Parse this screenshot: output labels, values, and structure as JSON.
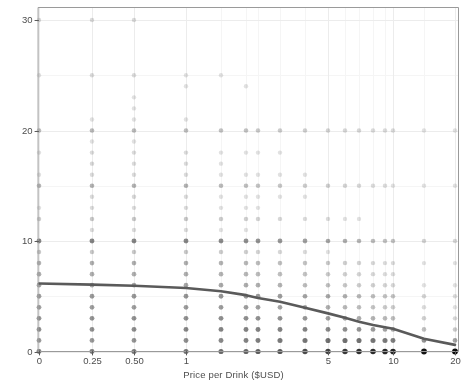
{
  "chart_data": {
    "type": "scatter",
    "title": "",
    "subtitle": "",
    "xlabel": "Price per Drink ($USD)",
    "ylabel": "Hypothetical Drinks Purchased",
    "x_scale": "log-like-ordinal",
    "xticks": [
      0,
      0.25,
      0.5,
      1,
      5,
      10,
      20
    ],
    "xtick_labels": [
      "0",
      "0.25",
      "0.50",
      "1",
      "5",
      "10",
      "20"
    ],
    "xtick_px": [
      39,
      92,
      134,
      186,
      328,
      390,
      455
    ],
    "yticks": [
      0,
      10,
      20,
      30
    ],
    "ytick_labels": [
      "0",
      "10",
      "20",
      "30"
    ],
    "ylim": [
      0,
      31
    ],
    "grid": true,
    "grid_major_color": "#ececec",
    "grid_minor_color": "#f5f5f5",
    "panel_border_color": "#9a9a9a",
    "point_color": "#111111",
    "point_shape": "circle",
    "point_radius_px": 2.6,
    "point_alpha_note": "alpha proportional to count of overlapping responses",
    "legend": "none",
    "legend_position": "none",
    "prices": [
      0,
      0.25,
      0.5,
      1,
      1.5,
      2,
      2.5,
      3,
      4,
      5,
      6,
      7,
      8,
      9,
      10,
      15,
      20
    ],
    "price_px": [
      39,
      92,
      134,
      186,
      221,
      246,
      258,
      280,
      305,
      328,
      345,
      359,
      373,
      385,
      393,
      424,
      455
    ],
    "y_values_grid": [
      0,
      1,
      2,
      3,
      4,
      5,
      6,
      7,
      8,
      9,
      10,
      11,
      12,
      13,
      14,
      15,
      16,
      17,
      18,
      19,
      20,
      21,
      22,
      23,
      24,
      25,
      26,
      27,
      28,
      29,
      30
    ],
    "counts": [
      {
        "price": 0,
        "points": [
          [
            0,
            60
          ],
          [
            1,
            34
          ],
          [
            2,
            42
          ],
          [
            3,
            38
          ],
          [
            4,
            30
          ],
          [
            5,
            30
          ],
          [
            6,
            26
          ],
          [
            7,
            20
          ],
          [
            8,
            18
          ],
          [
            9,
            8
          ],
          [
            10,
            52
          ],
          [
            12,
            6
          ],
          [
            13,
            2
          ],
          [
            15,
            16
          ],
          [
            16,
            2
          ],
          [
            18,
            2
          ],
          [
            20,
            12
          ],
          [
            25,
            2
          ],
          [
            30,
            3
          ]
        ]
      },
      {
        "price": 0.25,
        "points": [
          [
            0,
            62
          ],
          [
            1,
            36
          ],
          [
            2,
            44
          ],
          [
            3,
            40
          ],
          [
            4,
            32
          ],
          [
            5,
            34
          ],
          [
            6,
            26
          ],
          [
            7,
            20
          ],
          [
            8,
            20
          ],
          [
            9,
            8
          ],
          [
            10,
            54
          ],
          [
            11,
            3
          ],
          [
            12,
            8
          ],
          [
            13,
            3
          ],
          [
            14,
            3
          ],
          [
            15,
            18
          ],
          [
            16,
            3
          ],
          [
            17,
            4
          ],
          [
            18,
            3
          ],
          [
            19,
            2
          ],
          [
            20,
            14
          ],
          [
            21,
            2
          ],
          [
            25,
            3
          ],
          [
            30,
            3
          ]
        ]
      },
      {
        "price": 0.5,
        "points": [
          [
            0,
            66
          ],
          [
            1,
            40
          ],
          [
            2,
            48
          ],
          [
            3,
            42
          ],
          [
            4,
            32
          ],
          [
            5,
            36
          ],
          [
            6,
            26
          ],
          [
            7,
            20
          ],
          [
            8,
            20
          ],
          [
            9,
            8
          ],
          [
            10,
            54
          ],
          [
            11,
            3
          ],
          [
            12,
            8
          ],
          [
            13,
            3
          ],
          [
            14,
            4
          ],
          [
            15,
            18
          ],
          [
            16,
            3
          ],
          [
            17,
            3
          ],
          [
            18,
            3
          ],
          [
            19,
            2
          ],
          [
            20,
            14
          ],
          [
            21,
            2
          ],
          [
            22,
            2
          ],
          [
            23,
            2
          ],
          [
            25,
            3
          ],
          [
            30,
            3
          ]
        ]
      },
      {
        "price": 1,
        "points": [
          [
            0,
            74
          ],
          [
            1,
            46
          ],
          [
            2,
            54
          ],
          [
            3,
            44
          ],
          [
            4,
            34
          ],
          [
            5,
            38
          ],
          [
            6,
            26
          ],
          [
            7,
            20
          ],
          [
            8,
            20
          ],
          [
            9,
            8
          ],
          [
            10,
            52
          ],
          [
            11,
            3
          ],
          [
            12,
            8
          ],
          [
            13,
            3
          ],
          [
            14,
            3
          ],
          [
            15,
            18
          ],
          [
            16,
            3
          ],
          [
            17,
            3
          ],
          [
            18,
            3
          ],
          [
            20,
            12
          ],
          [
            21,
            2
          ],
          [
            24,
            2
          ],
          [
            25,
            2
          ]
        ]
      },
      {
        "price": 1.5,
        "points": [
          [
            0,
            82
          ],
          [
            1,
            52
          ],
          [
            2,
            56
          ],
          [
            3,
            46
          ],
          [
            4,
            34
          ],
          [
            5,
            38
          ],
          [
            6,
            24
          ],
          [
            7,
            18
          ],
          [
            8,
            18
          ],
          [
            9,
            7
          ],
          [
            10,
            48
          ],
          [
            11,
            2
          ],
          [
            12,
            7
          ],
          [
            13,
            2
          ],
          [
            14,
            2
          ],
          [
            15,
            14
          ],
          [
            16,
            2
          ],
          [
            17,
            2
          ],
          [
            18,
            2
          ],
          [
            20,
            10
          ],
          [
            25,
            2
          ]
        ]
      },
      {
        "price": 2,
        "points": [
          [
            0,
            92
          ],
          [
            1,
            58
          ],
          [
            2,
            58
          ],
          [
            3,
            46
          ],
          [
            4,
            32
          ],
          [
            5,
            36
          ],
          [
            6,
            22
          ],
          [
            7,
            16
          ],
          [
            8,
            16
          ],
          [
            9,
            6
          ],
          [
            10,
            44
          ],
          [
            11,
            2
          ],
          [
            12,
            6
          ],
          [
            13,
            2
          ],
          [
            14,
            2
          ],
          [
            15,
            12
          ],
          [
            16,
            2
          ],
          [
            18,
            2
          ],
          [
            20,
            10
          ],
          [
            24,
            2
          ]
        ]
      },
      {
        "price": 2.5,
        "points": [
          [
            0,
            102
          ],
          [
            1,
            62
          ],
          [
            2,
            58
          ],
          [
            3,
            44
          ],
          [
            4,
            30
          ],
          [
            5,
            34
          ],
          [
            6,
            20
          ],
          [
            7,
            14
          ],
          [
            8,
            14
          ],
          [
            9,
            5
          ],
          [
            10,
            40
          ],
          [
            12,
            5
          ],
          [
            13,
            2
          ],
          [
            14,
            2
          ],
          [
            15,
            10
          ],
          [
            16,
            2
          ],
          [
            18,
            2
          ],
          [
            20,
            8
          ]
        ]
      },
      {
        "price": 3,
        "points": [
          [
            0,
            116
          ],
          [
            1,
            68
          ],
          [
            2,
            58
          ],
          [
            3,
            42
          ],
          [
            4,
            28
          ],
          [
            5,
            32
          ],
          [
            6,
            18
          ],
          [
            7,
            12
          ],
          [
            8,
            12
          ],
          [
            9,
            4
          ],
          [
            10,
            36
          ],
          [
            12,
            4
          ],
          [
            14,
            2
          ],
          [
            15,
            9
          ],
          [
            16,
            2
          ],
          [
            18,
            2
          ],
          [
            20,
            7
          ]
        ]
      },
      {
        "price": 4,
        "points": [
          [
            0,
            136
          ],
          [
            1,
            74
          ],
          [
            2,
            56
          ],
          [
            3,
            38
          ],
          [
            4,
            24
          ],
          [
            5,
            28
          ],
          [
            6,
            14
          ],
          [
            7,
            10
          ],
          [
            8,
            10
          ],
          [
            9,
            3
          ],
          [
            10,
            30
          ],
          [
            12,
            3
          ],
          [
            14,
            2
          ],
          [
            15,
            7
          ],
          [
            16,
            2
          ],
          [
            20,
            6
          ]
        ]
      },
      {
        "price": 5,
        "points": [
          [
            0,
            158
          ],
          [
            1,
            80
          ],
          [
            2,
            52
          ],
          [
            3,
            32
          ],
          [
            4,
            20
          ],
          [
            5,
            24
          ],
          [
            6,
            12
          ],
          [
            7,
            8
          ],
          [
            8,
            8
          ],
          [
            9,
            2
          ],
          [
            10,
            26
          ],
          [
            12,
            3
          ],
          [
            15,
            6
          ],
          [
            20,
            5
          ]
        ]
      },
      {
        "price": 6,
        "points": [
          [
            0,
            176
          ],
          [
            1,
            80
          ],
          [
            2,
            46
          ],
          [
            3,
            28
          ],
          [
            4,
            16
          ],
          [
            5,
            20
          ],
          [
            6,
            9
          ],
          [
            7,
            6
          ],
          [
            8,
            6
          ],
          [
            10,
            20
          ],
          [
            12,
            2
          ],
          [
            15,
            5
          ],
          [
            20,
            4
          ]
        ]
      },
      {
        "price": 7,
        "points": [
          [
            0,
            192
          ],
          [
            1,
            78
          ],
          [
            2,
            40
          ],
          [
            3,
            22
          ],
          [
            4,
            13
          ],
          [
            5,
            16
          ],
          [
            6,
            7
          ],
          [
            7,
            5
          ],
          [
            8,
            5
          ],
          [
            10,
            16
          ],
          [
            12,
            2
          ],
          [
            15,
            4
          ],
          [
            20,
            4
          ]
        ]
      },
      {
        "price": 8,
        "points": [
          [
            0,
            206
          ],
          [
            1,
            74
          ],
          [
            2,
            34
          ],
          [
            3,
            18
          ],
          [
            4,
            10
          ],
          [
            5,
            13
          ],
          [
            6,
            6
          ],
          [
            7,
            4
          ],
          [
            8,
            4
          ],
          [
            10,
            13
          ],
          [
            15,
            3
          ],
          [
            20,
            3
          ]
        ]
      },
      {
        "price": 9,
        "points": [
          [
            0,
            216
          ],
          [
            1,
            68
          ],
          [
            2,
            28
          ],
          [
            3,
            15
          ],
          [
            4,
            8
          ],
          [
            5,
            11
          ],
          [
            6,
            5
          ],
          [
            7,
            3
          ],
          [
            8,
            3
          ],
          [
            10,
            11
          ],
          [
            15,
            3
          ],
          [
            20,
            3
          ]
        ]
      },
      {
        "price": 10,
        "points": [
          [
            0,
            224
          ],
          [
            1,
            62
          ],
          [
            2,
            24
          ],
          [
            3,
            13
          ],
          [
            4,
            7
          ],
          [
            5,
            10
          ],
          [
            6,
            4
          ],
          [
            7,
            3
          ],
          [
            8,
            3
          ],
          [
            10,
            10
          ],
          [
            15,
            2
          ],
          [
            20,
            3
          ]
        ]
      },
      {
        "price": 15,
        "points": [
          [
            0,
            268
          ],
          [
            1,
            40
          ],
          [
            2,
            12
          ],
          [
            3,
            6
          ],
          [
            4,
            3
          ],
          [
            5,
            5
          ],
          [
            6,
            2
          ],
          [
            8,
            2
          ],
          [
            10,
            5
          ],
          [
            15,
            2
          ],
          [
            20,
            2
          ]
        ]
      },
      {
        "price": 20,
        "points": [
          [
            0,
            292
          ],
          [
            1,
            28
          ],
          [
            2,
            8
          ],
          [
            3,
            4
          ],
          [
            4,
            2
          ],
          [
            5,
            3
          ],
          [
            6,
            2
          ],
          [
            8,
            2
          ],
          [
            10,
            4
          ],
          [
            15,
            2
          ],
          [
            20,
            2
          ]
        ]
      }
    ],
    "trend_line": {
      "label": "mean demand curve",
      "color": "#5a5a5a",
      "width_px": 2.6,
      "x": [
        0,
        0.25,
        0.5,
        1,
        1.5,
        2,
        2.5,
        3,
        4,
        5,
        6,
        7,
        8,
        9,
        10,
        15,
        20
      ],
      "y": [
        6.15,
        6.05,
        5.95,
        5.75,
        5.45,
        5.1,
        4.85,
        4.5,
        3.95,
        3.45,
        3.05,
        2.7,
        2.4,
        2.2,
        2.05,
        1.15,
        0.6
      ]
    }
  },
  "axes": {
    "x_title": "Price per Drink ($USD)",
    "y_title": "Hypothetical Drinks Purchased",
    "x_tick_labels": [
      "0",
      "0.25",
      "0.50",
      "1",
      "5",
      "10",
      "20"
    ],
    "y_tick_labels": [
      "0",
      "10",
      "20",
      "30"
    ]
  }
}
